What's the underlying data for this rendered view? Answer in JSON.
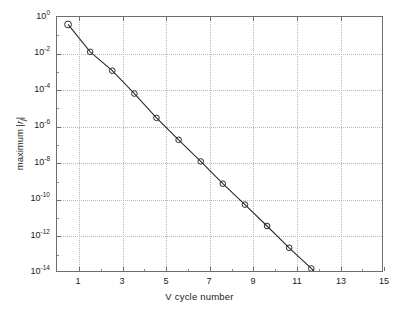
{
  "figure": {
    "background": "#ffffff",
    "axis_color": "#6e6e6e",
    "grid_color": "#b9b9b9",
    "line_color": "#2b2b2b",
    "marker": "open-circle"
  },
  "chart_data": {
    "type": "line",
    "title": "",
    "xlabel": "V  cycle number",
    "ylabel": "maximum | r_j |",
    "ylabel_parts": {
      "prefix": "maximum |",
      "symbol": "r",
      "subscript": "j",
      "suffix": "|"
    },
    "xlim": [
      0.5,
      15.2
    ],
    "ylim": [
      1e-14,
      1
    ],
    "yscale": "log",
    "xscale": "linear",
    "grid": true,
    "legend": null,
    "xticks": [
      1,
      3,
      5,
      7,
      9,
      11,
      13,
      15
    ],
    "xticklabels": [
      "1",
      "3",
      "5",
      "7",
      "9",
      "11",
      "13",
      "15"
    ],
    "xticks_minor": [
      2,
      4,
      6,
      8,
      10,
      12,
      14
    ],
    "yticks": [
      1e-14,
      1e-12,
      1e-10,
      1e-08,
      1e-06,
      0.0001,
      0.01,
      1
    ],
    "yticklabels": [
      {
        "mantissa": "10",
        "exponent": "-14"
      },
      {
        "mantissa": "10",
        "exponent": "-12"
      },
      {
        "mantissa": "10",
        "exponent": "-10"
      },
      {
        "mantissa": "10",
        "exponent": "-8"
      },
      {
        "mantissa": "10",
        "exponent": "-6"
      },
      {
        "mantissa": "10",
        "exponent": "-4"
      },
      {
        "mantissa": "10",
        "exponent": "-2"
      },
      {
        "mantissa": "10",
        "exponent": "0"
      }
    ],
    "series": [
      {
        "name": "maximum residual per V cycle",
        "x": [
          1,
          2,
          3,
          4,
          5,
          6,
          7,
          8,
          9,
          10,
          11,
          12,
          13,
          14,
          15
        ],
        "y": [
          0.39,
          0.012,
          0.0011,
          6e-05,
          2.5e-06,
          1.7e-07,
          1.1e-08,
          6.5e-10,
          4.5e-11,
          3e-12,
          2e-13,
          1.4e-14,
          9e-16,
          6e-17,
          4e-18
        ],
        "y_decades_below_one": [
          0.41,
          1.92,
          2.96,
          4.22,
          5.56,
          6.77,
          7.96,
          9.19,
          10.34,
          11.52,
          12.72,
          13.86,
          15.02,
          16.16,
          17.3
        ]
      }
    ]
  }
}
